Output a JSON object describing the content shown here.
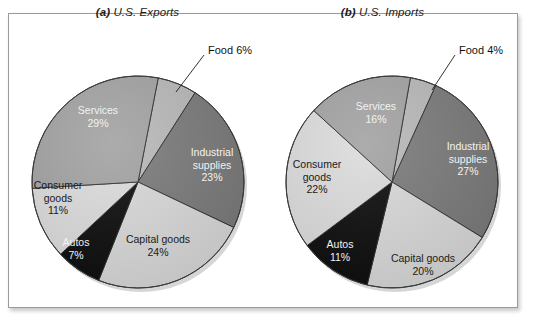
{
  "figure": {
    "background": "#ffffff",
    "frame_color": "#9a9a9a"
  },
  "panels": [
    {
      "id": "exports",
      "tag": "(a)",
      "title": "U.S. Exports",
      "title_full": "(a) U.S. Exports"
    },
    {
      "id": "imports",
      "tag": "(b)",
      "title": "U.S. Imports",
      "title_full": "(b) U.S. Imports"
    }
  ],
  "palette": {
    "industrial_supplies": "#7b7b7b",
    "capital_goods": "#d9d9d9",
    "autos": "#0d0d0d",
    "consumer_goods": "#dcdcdc",
    "services": "#a3a3a3",
    "food": "#b9b9b9",
    "outline": "#2a2a2a",
    "label_light": "#f2f2f2",
    "label_dark": "#1a1a1a"
  },
  "exports": {
    "food_callout": "Food 6%",
    "labels": {
      "industrial_supplies": {
        "name_line1": "Industrial",
        "name_line2": "supplies",
        "pct": "23%"
      },
      "capital_goods": {
        "name_line1": "Capital goods",
        "pct": "24%"
      },
      "autos": {
        "name_line1": "Autos",
        "pct": "7%"
      },
      "consumer_goods": {
        "name_line1": "Consumer",
        "name_line2": "goods",
        "pct": "11%"
      },
      "services": {
        "name_line1": "Services",
        "pct": "29%"
      }
    }
  },
  "imports": {
    "food_callout": "Food 4%",
    "labels": {
      "industrial_supplies": {
        "name_line1": "Industrial",
        "name_line2": "supplies",
        "pct": "27%"
      },
      "capital_goods": {
        "name_line1": "Capital goods",
        "pct": "20%"
      },
      "autos": {
        "name_line1": "Autos",
        "pct": "11%"
      },
      "consumer_goods": {
        "name_line1": "Consumer",
        "name_line2": "goods",
        "pct": "22%"
      },
      "services": {
        "name_line1": "Services",
        "pct": "16%"
      }
    }
  },
  "chart_data": [
    {
      "type": "pie",
      "title": "(a) U.S. Exports",
      "categories": [
        "Food",
        "Industrial supplies",
        "Capital goods",
        "Autos",
        "Consumer goods",
        "Services"
      ],
      "values": [
        6,
        23,
        24,
        7,
        11,
        29
      ],
      "value_unit": "percent",
      "labels": [
        "Food 6%",
        "Industrial supplies 23%",
        "Capital goods 24%",
        "Autos 7%",
        "Consumer goods 11%",
        "Services 29%"
      ],
      "colors": [
        "#b9b9b9",
        "#7b7b7b",
        "#d9d9d9",
        "#0d0d0d",
        "#dcdcdc",
        "#a3a3a3"
      ],
      "legend": "none",
      "annotations": [
        "Food 6% label connected by leader line to the Food wedge"
      ]
    },
    {
      "type": "pie",
      "title": "(b) U.S. Imports",
      "categories": [
        "Food",
        "Industrial supplies",
        "Capital goods",
        "Autos",
        "Consumer goods",
        "Services"
      ],
      "values": [
        4,
        27,
        20,
        11,
        22,
        16
      ],
      "value_unit": "percent",
      "labels": [
        "Food 4%",
        "Industrial supplies 27%",
        "Capital goods 20%",
        "Autos 11%",
        "Consumer goods 22%",
        "Services 16%"
      ],
      "colors": [
        "#b9b9b9",
        "#7b7b7b",
        "#d9d9d9",
        "#0d0d0d",
        "#dcdcdc",
        "#a3a3a3"
      ],
      "legend": "none",
      "annotations": [
        "Food 4% label connected by leader line to the Food wedge"
      ]
    }
  ]
}
